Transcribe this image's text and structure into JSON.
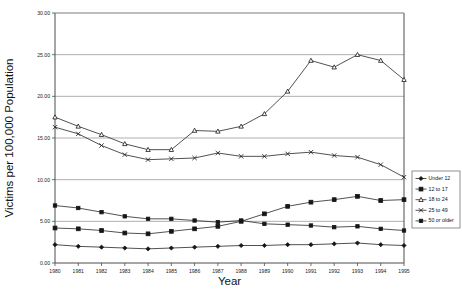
{
  "chart_data": {
    "type": "line",
    "title": "",
    "xlabel": "Year",
    "ylabel": "Victims per 100,000 Population",
    "x": [
      1980,
      1981,
      1982,
      1983,
      1984,
      1985,
      1986,
      1987,
      1988,
      1989,
      1990,
      1991,
      1992,
      1993,
      1994,
      1995
    ],
    "xtick_labels": [
      "1980",
      "1981",
      "1982",
      "1983",
      "1984",
      "1985",
      "1986",
      "1987",
      "1988",
      "1989",
      "1990",
      "1991",
      "1992",
      "1993",
      "1994",
      "1995"
    ],
    "ytick_labels": [
      "0.00",
      "5.00",
      "10.00",
      "15.00",
      "20.00",
      "25.00",
      "30.00"
    ],
    "ytick_values": [
      0,
      5,
      10,
      15,
      20,
      25,
      30
    ],
    "xlim": [
      1980,
      1995
    ],
    "ylim": [
      0,
      30
    ],
    "grid": "horizontal",
    "legend_position": "right-outside",
    "series": [
      {
        "name": "Under 12",
        "marker": "diamond",
        "values": [
          2.2,
          2.0,
          1.9,
          1.8,
          1.7,
          1.8,
          1.9,
          2.0,
          2.1,
          2.1,
          2.2,
          2.2,
          2.3,
          2.4,
          2.2,
          2.1
        ]
      },
      {
        "name": "12 to 17",
        "marker": "square",
        "values": [
          4.2,
          4.1,
          3.9,
          3.6,
          3.5,
          3.8,
          4.1,
          4.4,
          5.0,
          5.9,
          6.8,
          7.3,
          7.6,
          8.0,
          7.5,
          7.6
        ]
      },
      {
        "name": "18 to 24",
        "marker": "triangle",
        "values": [
          17.5,
          16.4,
          15.4,
          14.3,
          13.6,
          13.6,
          15.9,
          15.8,
          16.4,
          17.9,
          20.6,
          24.3,
          23.5,
          25.0,
          24.3,
          22.0
        ]
      },
      {
        "name": "25 to 49",
        "marker": "x",
        "values": [
          16.3,
          15.5,
          14.1,
          13.0,
          12.4,
          12.5,
          12.6,
          13.2,
          12.8,
          12.8,
          13.1,
          13.3,
          12.9,
          12.7,
          11.8,
          10.3
        ]
      },
      {
        "name": "50 or older",
        "marker": "square-small",
        "values": [
          6.9,
          6.6,
          6.1,
          5.6,
          5.3,
          5.3,
          5.1,
          4.9,
          5.1,
          4.7,
          4.6,
          4.5,
          4.3,
          4.4,
          4.1,
          3.9
        ]
      }
    ]
  },
  "legend": {
    "items": [
      {
        "label": "Under 12"
      },
      {
        "label": "12 to 17"
      },
      {
        "label": "18 to 24"
      },
      {
        "label": "25 to 49"
      },
      {
        "label": "50 or older"
      }
    ]
  },
  "caption": {
    "text": ""
  },
  "colors": {
    "series": "#262626",
    "grid": "#8c8c8c",
    "axis": "#4d4d4d",
    "background": "#ffffff"
  }
}
